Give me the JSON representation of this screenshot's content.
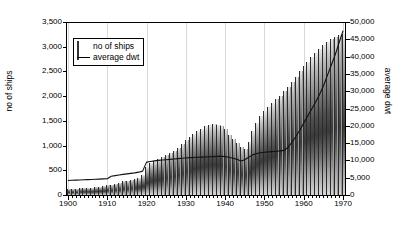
{
  "chart_data": {
    "type": "bar",
    "title": "",
    "subtitle": "",
    "xlabel": "",
    "ylabel": "no of ships",
    "y2label": "average dwt",
    "ylim": [
      0,
      3500
    ],
    "y2lim": [
      0,
      50000
    ],
    "xlim": [
      1900,
      1970
    ],
    "grid": "vertical-light",
    "legend_position": "upper-left-inside",
    "y_ticks": [
      "0",
      "500",
      "1,000",
      "1,500",
      "2,000",
      "2,500",
      "3,000",
      "3,500"
    ],
    "y_tick_values": [
      0,
      500,
      1000,
      1500,
      2000,
      2500,
      3000,
      3500
    ],
    "y2_ticks": [
      "0",
      "5,000",
      "10,000",
      "15,000",
      "20,000",
      "25,000",
      "30,000",
      "35,000",
      "40,000",
      "45,000",
      "50,000"
    ],
    "y2_tick_values": [
      0,
      5000,
      10000,
      15000,
      20000,
      25000,
      30000,
      35000,
      40000,
      45000,
      50000
    ],
    "x_ticks": [
      "1900",
      "1910",
      "1920",
      "1930",
      "1940",
      "1950",
      "1960",
      "1970"
    ],
    "x_tick_values": [
      1900,
      1910,
      1920,
      1930,
      1940,
      1950,
      1960,
      1970
    ],
    "legend": [
      {
        "label": "no of ships",
        "key": "bar-swatch"
      },
      {
        "label": "average dwt",
        "key": "line-swatch"
      }
    ],
    "x": [
      1900,
      1901,
      1902,
      1903,
      1904,
      1905,
      1906,
      1907,
      1908,
      1909,
      1910,
      1911,
      1912,
      1913,
      1914,
      1915,
      1916,
      1917,
      1918,
      1919,
      1920,
      1921,
      1922,
      1923,
      1924,
      1925,
      1926,
      1927,
      1928,
      1929,
      1930,
      1931,
      1932,
      1933,
      1934,
      1935,
      1936,
      1937,
      1938,
      1939,
      1940,
      1941,
      1942,
      1943,
      1944,
      1945,
      1946,
      1947,
      1948,
      1949,
      1950,
      1951,
      1952,
      1953,
      1954,
      1955,
      1956,
      1957,
      1958,
      1959,
      1960,
      1961,
      1962,
      1963,
      1964,
      1965,
      1966,
      1967,
      1968,
      1969,
      1970
    ],
    "series": [
      {
        "name": "no of ships",
        "axis": "left",
        "type": "bar",
        "values": [
          120,
          125,
          130,
          132,
          140,
          145,
          150,
          160,
          170,
          180,
          195,
          205,
          225,
          250,
          275,
          290,
          310,
          330,
          350,
          400,
          560,
          640,
          690,
          720,
          760,
          800,
          850,
          900,
          960,
          1030,
          1110,
          1180,
          1240,
          1290,
          1340,
          1390,
          1420,
          1430,
          1420,
          1400,
          1330,
          1210,
          1130,
          1060,
          980,
          940,
          1080,
          1300,
          1460,
          1590,
          1690,
          1780,
          1860,
          1940,
          2010,
          2100,
          2190,
          2280,
          2390,
          2500,
          2610,
          2700,
          2790,
          2880,
          2960,
          3030,
          3090,
          3150,
          3190,
          3230,
          3260
        ]
      },
      {
        "name": "average dwt",
        "axis": "right",
        "type": "line",
        "values": [
          4200,
          4250,
          4300,
          4350,
          4400,
          4450,
          4500,
          4550,
          4600,
          4650,
          4700,
          5400,
          5600,
          5800,
          5950,
          6100,
          6250,
          6400,
          6600,
          6900,
          9500,
          9700,
          9850,
          10000,
          10100,
          10200,
          10300,
          10400,
          10500,
          10600,
          10700,
          10800,
          10850,
          10900,
          10950,
          11000,
          11050,
          11100,
          11150,
          11200,
          11100,
          10900,
          10600,
          10300,
          9800,
          10200,
          10900,
          11600,
          12000,
          12200,
          12350,
          12450,
          12550,
          12650,
          12750,
          12900,
          13800,
          15200,
          16900,
          18700,
          20800,
          22800,
          24800,
          26800,
          29000,
          31500,
          34500,
          37500,
          40500,
          44000,
          47500
        ]
      }
    ]
  }
}
